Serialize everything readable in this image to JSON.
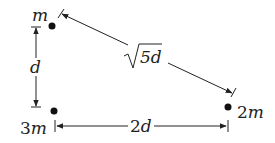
{
  "diagram": {
    "masses": [
      {
        "id": "top",
        "label": "m",
        "x": 52,
        "y": 26
      },
      {
        "id": "bottom-left",
        "label": "3m",
        "x": 54,
        "y": 111
      },
      {
        "id": "right",
        "label": "2m",
        "x": 228,
        "y": 107
      }
    ],
    "distances": {
      "vertical": "d",
      "diagonal_prefix": "5d",
      "horizontal": "2d"
    },
    "colors": {
      "ink": "#222222",
      "background": "#ffffff"
    }
  }
}
